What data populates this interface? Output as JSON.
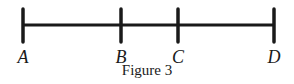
{
  "figure": {
    "caption": "Figure 3",
    "points": [
      {
        "label": "A",
        "x": 23
      },
      {
        "label": "B",
        "x": 121
      },
      {
        "label": "C",
        "x": 178
      },
      {
        "label": "D",
        "x": 274
      }
    ],
    "line_color": "#1a1a1a"
  }
}
